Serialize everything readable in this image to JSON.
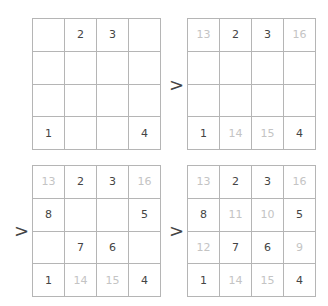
{
  "arrow_symbol": ">",
  "colors": {
    "grid_line": "#b5b5b5",
    "given": "#444444",
    "derived": "#c4c4c4"
  },
  "grids": [
    {
      "cells": [
        {
          "v": "",
          "f": false
        },
        {
          "v": "2",
          "f": false
        },
        {
          "v": "3",
          "f": false
        },
        {
          "v": "",
          "f": false
        },
        {
          "v": "",
          "f": false
        },
        {
          "v": "",
          "f": false
        },
        {
          "v": "",
          "f": false
        },
        {
          "v": "",
          "f": false
        },
        {
          "v": "",
          "f": false
        },
        {
          "v": "",
          "f": false
        },
        {
          "v": "",
          "f": false
        },
        {
          "v": "",
          "f": false
        },
        {
          "v": "1",
          "f": false
        },
        {
          "v": "",
          "f": false
        },
        {
          "v": "",
          "f": false
        },
        {
          "v": "4",
          "f": false
        }
      ]
    },
    {
      "cells": [
        {
          "v": "13",
          "f": true
        },
        {
          "v": "2",
          "f": false
        },
        {
          "v": "3",
          "f": false
        },
        {
          "v": "16",
          "f": true
        },
        {
          "v": "",
          "f": false
        },
        {
          "v": "",
          "f": false
        },
        {
          "v": "",
          "f": false
        },
        {
          "v": "",
          "f": false
        },
        {
          "v": "",
          "f": false
        },
        {
          "v": "",
          "f": false
        },
        {
          "v": "",
          "f": false
        },
        {
          "v": "",
          "f": false
        },
        {
          "v": "1",
          "f": false
        },
        {
          "v": "14",
          "f": true
        },
        {
          "v": "15",
          "f": true
        },
        {
          "v": "4",
          "f": false
        }
      ]
    },
    {
      "cells": [
        {
          "v": "13",
          "f": true
        },
        {
          "v": "2",
          "f": false
        },
        {
          "v": "3",
          "f": false
        },
        {
          "v": "16",
          "f": true
        },
        {
          "v": "8",
          "f": false
        },
        {
          "v": "",
          "f": false
        },
        {
          "v": "",
          "f": false
        },
        {
          "v": "5",
          "f": false
        },
        {
          "v": "",
          "f": false
        },
        {
          "v": "7",
          "f": false
        },
        {
          "v": "6",
          "f": false
        },
        {
          "v": "",
          "f": false
        },
        {
          "v": "1",
          "f": false
        },
        {
          "v": "14",
          "f": true
        },
        {
          "v": "15",
          "f": true
        },
        {
          "v": "4",
          "f": false
        }
      ]
    },
    {
      "cells": [
        {
          "v": "13",
          "f": true
        },
        {
          "v": "2",
          "f": false
        },
        {
          "v": "3",
          "f": false
        },
        {
          "v": "16",
          "f": true
        },
        {
          "v": "8",
          "f": false
        },
        {
          "v": "11",
          "f": true
        },
        {
          "v": "10",
          "f": true
        },
        {
          "v": "5",
          "f": false
        },
        {
          "v": "12",
          "f": true
        },
        {
          "v": "7",
          "f": false
        },
        {
          "v": "6",
          "f": false
        },
        {
          "v": "9",
          "f": true
        },
        {
          "v": "1",
          "f": false
        },
        {
          "v": "14",
          "f": true
        },
        {
          "v": "15",
          "f": true
        },
        {
          "v": "4",
          "f": false
        }
      ]
    }
  ]
}
